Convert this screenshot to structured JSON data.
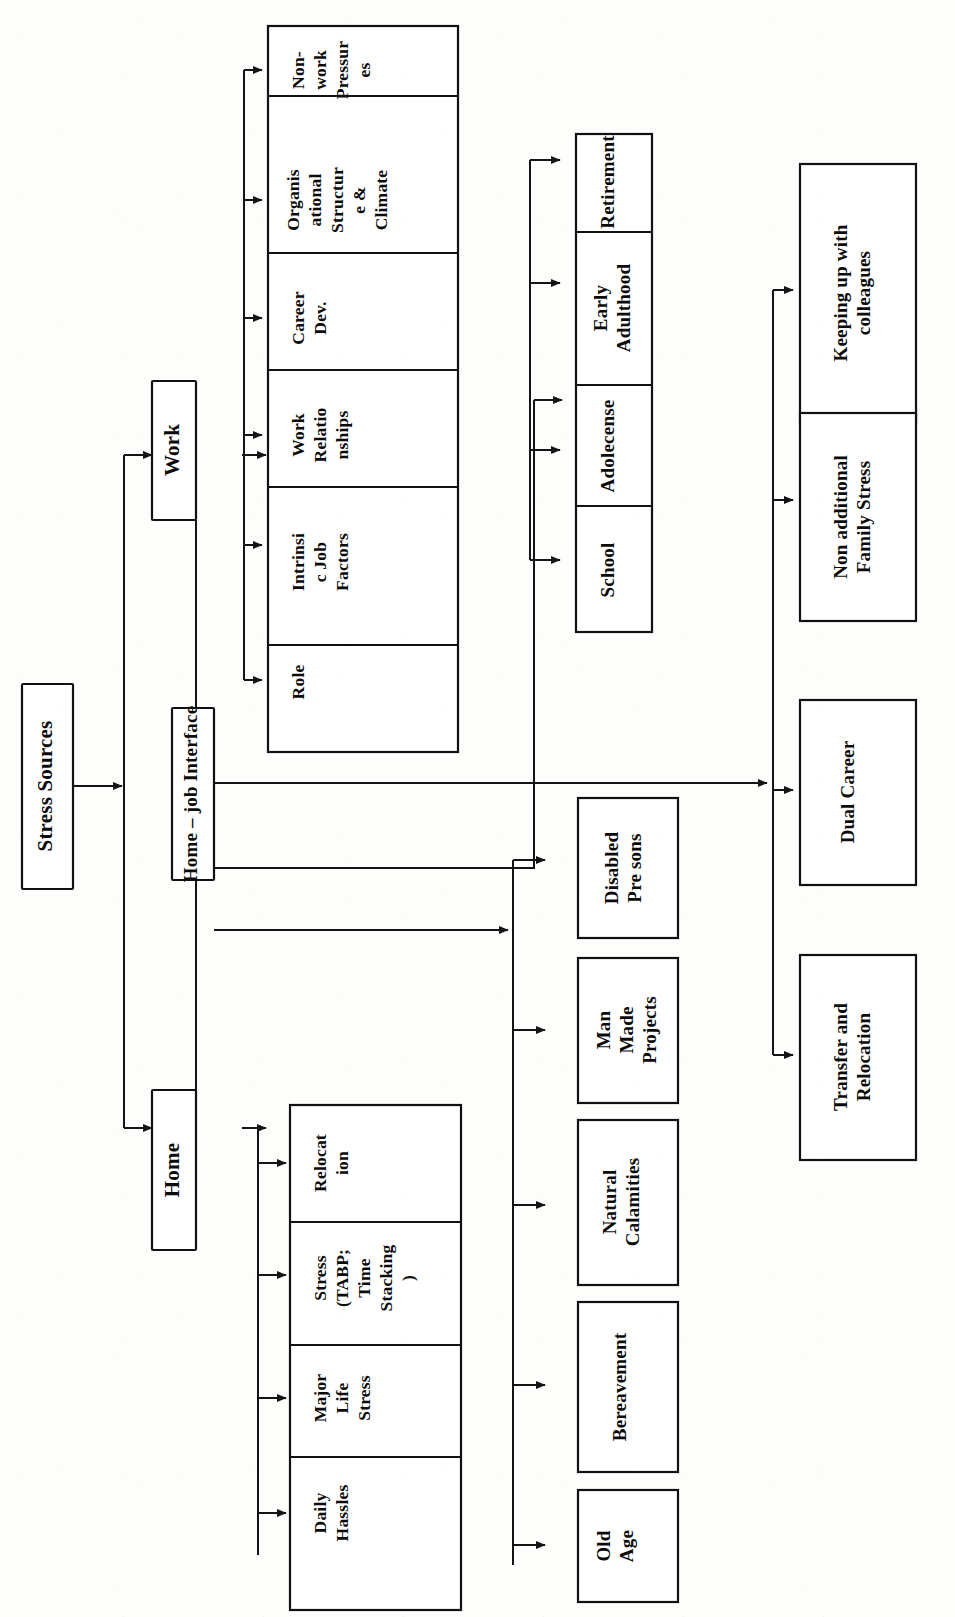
{
  "diagram": {
    "title": "Stress Sources",
    "orientation": "rotated-90-ccw",
    "root": {
      "id": "stress-sources",
      "label": "Stress Sources"
    },
    "level1": [
      {
        "id": "work",
        "label": "Work"
      },
      {
        "id": "home-job-interface",
        "label": "Home – job Interface"
      },
      {
        "id": "home",
        "label": "Home"
      }
    ],
    "work_factors": [
      {
        "id": "role",
        "label": "Role"
      },
      {
        "id": "intrinsic-job-factors",
        "label": "Intrinsi\nc Job\nFactors"
      },
      {
        "id": "work-relationships",
        "label": "Work\nRelatio\nnships"
      },
      {
        "id": "career-dev",
        "label": "Career\nDev."
      },
      {
        "id": "organisational-structure-climate",
        "label": "Organis\national\nStructur\ne &\nClimate"
      },
      {
        "id": "non-work-pressures",
        "label": "Non-\nwork\nPressur\nes"
      }
    ],
    "life_stages": [
      {
        "id": "school",
        "label": "School"
      },
      {
        "id": "adolecense",
        "label": "Adolecense"
      },
      {
        "id": "early-adulthood",
        "label": "Early\nAdulthood"
      },
      {
        "id": "retirement",
        "label": "Retirement"
      }
    ],
    "life_events": [
      {
        "id": "old-age",
        "label": "Old\nAge"
      },
      {
        "id": "bereavement",
        "label": "Bereavement"
      },
      {
        "id": "natural-calamities",
        "label": "Natural\nCalamities"
      },
      {
        "id": "man-made-projects",
        "label": "Man\nMade\nProjects"
      },
      {
        "id": "disabled-persons",
        "label": "Disabled\nPre sons"
      }
    ],
    "interface_outcomes": [
      {
        "id": "transfer-and-relocation",
        "label": "Transfer and\nRelocation"
      },
      {
        "id": "dual-career",
        "label": "Dual Career"
      },
      {
        "id": "non-additional-family-stress",
        "label": "Non additional\nFamily Stress"
      },
      {
        "id": "keeping-up-with-colleagues",
        "label": "Keeping up with\ncolleagues"
      }
    ],
    "home_factors": [
      {
        "id": "daily-hassles",
        "label": "Daily\nHassles"
      },
      {
        "id": "major-life-stress",
        "label": "Major\nLife\nStress"
      },
      {
        "id": "stress-tabp-time-stacking",
        "label": "Stress\n(TABP;\nTime\nStacking\n)"
      },
      {
        "id": "relocation",
        "label": "Relocat\nion"
      }
    ],
    "colors": {
      "line": "#141414",
      "box_stroke": "#111111",
      "box_fill": "#ffffff",
      "text": "#0b0b0b",
      "page": "#fdfdfb"
    }
  }
}
